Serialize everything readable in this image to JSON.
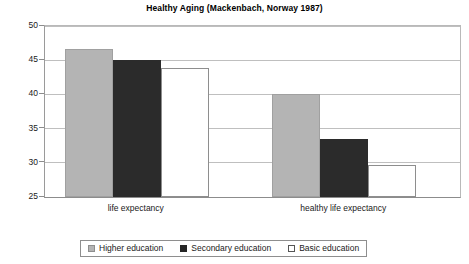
{
  "chart_data": {
    "type": "bar",
    "title": "Healthy Aging (Mackenbach, Norway 1987)",
    "xlabel": "",
    "ylabel": "",
    "ylim": [
      25,
      50
    ],
    "yticks": [
      25,
      30,
      35,
      40,
      45,
      50
    ],
    "ytick_labels": [
      "25",
      "30",
      "35",
      "40",
      "45",
      "50"
    ],
    "grid": true,
    "legend_position": "bottom",
    "categories": [
      "life expectancy",
      "healthy life expectancy"
    ],
    "series": [
      {
        "name": "Higher education",
        "color": "#b4b4b4",
        "values": [
          46.6,
          40.1
        ]
      },
      {
        "name": "Secondary education",
        "color": "#2b2b2b",
        "values": [
          45.0,
          33.5
        ]
      },
      {
        "name": "Basic education",
        "color": "#ffffff",
        "values": [
          43.8,
          29.7
        ]
      }
    ]
  },
  "colors": {
    "higher_education": "#b4b4b4",
    "secondary_education": "#2b2b2b",
    "basic_education": "#ffffff",
    "gridline": "#bfbfbf",
    "axis": "#8c8c8c",
    "background": "#ffffff",
    "text": "#1a1a1a"
  }
}
